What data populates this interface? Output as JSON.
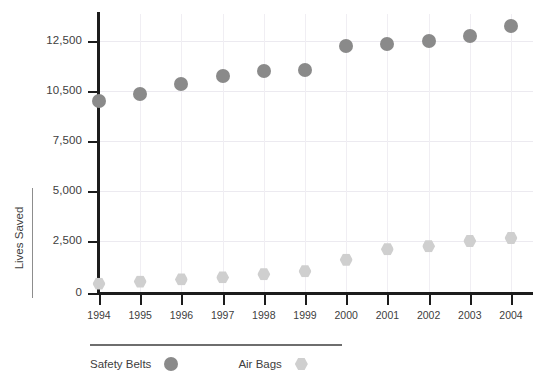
{
  "chart_data": {
    "type": "scatter",
    "title": "",
    "subtitle": "",
    "xlabel": "",
    "ylabel": "Lives Saved",
    "grid": true,
    "legend_position": "bottom-left",
    "categories": [
      "1994",
      "1995",
      "1996",
      "1997",
      "1998",
      "1999",
      "2000",
      "2001",
      "2002",
      "2003",
      "2004"
    ],
    "x": [
      1994,
      1995,
      1996,
      1997,
      1998,
      1999,
      2000,
      2001,
      2002,
      2003,
      2004
    ],
    "y_tick_labels": [
      "12,500",
      "10,500",
      "7,500",
      "5,000",
      "2,500",
      "0"
    ],
    "y_tick_values": [
      12500,
      10500,
      7500,
      5000,
      2500,
      0
    ],
    "ylim": [
      0,
      12500
    ],
    "y_axis_note": "tick spacing is uniform in pixels although values are unevenly spaced",
    "series": [
      {
        "name": "Safety Belts",
        "marker": "circle",
        "color": "#8a8a8a",
        "values": [
          9900,
          10300,
          10800,
          11100,
          11300,
          11350,
          12300,
          12400,
          12500,
          12700,
          13100
        ]
      },
      {
        "name": "Air Bags",
        "marker": "hexagon",
        "color": "#cfcfcf",
        "values": [
          450,
          550,
          650,
          750,
          900,
          1050,
          1600,
          2100,
          2250,
          2500,
          2650
        ]
      }
    ]
  },
  "legend": {
    "items": [
      {
        "label": "Safety Belts",
        "marker": "circle-marker",
        "color": "#8a8a8a"
      },
      {
        "label": "Air Bags",
        "marker": "hexagon-marker",
        "color": "#cfcfcf"
      }
    ]
  },
  "axis": {
    "y_title": "Lives Saved"
  }
}
